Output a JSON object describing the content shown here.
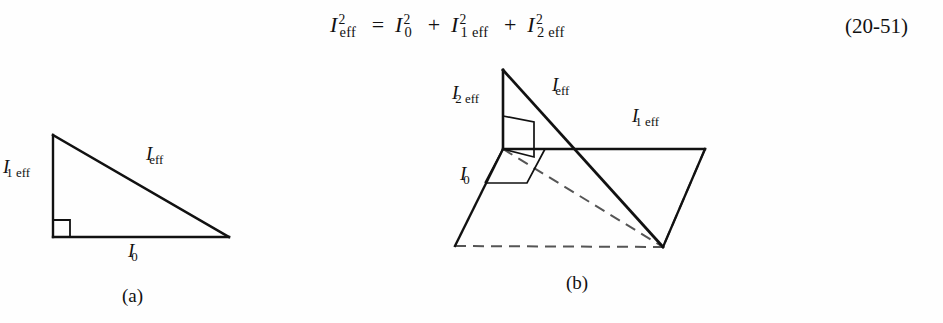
{
  "page": {
    "background_color": "#fefefe",
    "ink_color": "#111111"
  },
  "equation": {
    "name": "effective-current-identity",
    "full_text": "I²eff = I²0 + I²1eff + I²2eff",
    "lhs": {
      "base": "I",
      "superscript": "2",
      "subscript": "eff"
    },
    "relation": "=",
    "terms": [
      {
        "base": "I",
        "superscript": "2",
        "subscript": "0"
      },
      {
        "base": "I",
        "superscript": "2",
        "subscript": "1 eff"
      },
      {
        "base": "I",
        "superscript": "2",
        "subscript": "2 eff"
      }
    ],
    "operators": [
      "+",
      "+"
    ],
    "number": "(20-51)"
  },
  "figures": [
    {
      "id": "a",
      "caption": "(a)",
      "type": "right-triangle-2d",
      "description": "Planar right triangle showing Pythagorean relation between I0, I1 eff and I eff",
      "vertices": {
        "apex": [
          53,
          75
        ],
        "right_angle_corner": [
          53,
          177
        ],
        "base_right": [
          229,
          177
        ]
      },
      "right_angle_marker_at": "right_angle_corner",
      "labels": [
        {
          "name": "leg-vertical-label",
          "base": "I",
          "subscript": "1 eff",
          "x": 3,
          "y": 105
        },
        {
          "name": "hypotenuse-label",
          "base": "I",
          "subscript": "eff",
          "x": 146,
          "y": 92
        },
        {
          "name": "leg-horizontal-label",
          "base": "I",
          "subscript": "0",
          "x": 128,
          "y": 188
        }
      ]
    },
    {
      "id": "b",
      "caption": "(b)",
      "type": "right-triangle-3d",
      "description": "Three dimensional orthogonal construction: vertical I2 eff, horizontal I1 eff, oblique I0, with resultant I eff as space diagonal; hidden edges dashed",
      "vertices": {
        "apex_top": [
          103,
          20
        ],
        "origin": [
          103,
          99
        ],
        "oblique_far_left": [
          55,
          196
        ],
        "horizontal_right": [
          305,
          99
        ],
        "base_far_right": [
          263,
          197
        ],
        "diagonal_end": [
          263,
          197
        ]
      },
      "solid_edges": [
        [
          "apex_top",
          "origin"
        ],
        [
          "apex_top",
          "diagonal_end"
        ],
        [
          "origin",
          "horizontal_right"
        ],
        [
          "origin",
          "oblique_far_left"
        ],
        [
          "horizontal_right",
          "base_far_right"
        ]
      ],
      "dashed_edges": [
        [
          "oblique_far_left",
          "base_far_right"
        ],
        [
          "origin",
          "base_far_right"
        ],
        [
          "horizontal_right",
          "base_far_right"
        ]
      ],
      "right_angle_markers": 2,
      "labels": [
        {
          "name": "vertical-edge-label",
          "base": "I",
          "subscript": "2 eff",
          "x": 52,
          "y": 40
        },
        {
          "name": "diagonal-label",
          "base": "I",
          "subscript": "eff",
          "x": 152,
          "y": 32
        },
        {
          "name": "horizontal-edge-label",
          "base": "I",
          "subscript": "1 eff",
          "x": 232,
          "y": 62
        },
        {
          "name": "oblique-edge-label",
          "base": "I",
          "subscript": "0",
          "x": 60,
          "y": 120
        }
      ]
    }
  ]
}
